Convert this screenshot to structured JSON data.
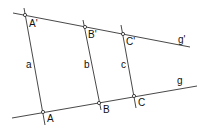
{
  "diagram": {
    "type": "parallel-lines-geometry",
    "colors": {
      "line": "#333333",
      "text": "#111111",
      "background": "#ffffff"
    },
    "lines": [
      {
        "id": "g_prime",
        "label": "g'",
        "x1": 13,
        "y1": 13,
        "x2": 190,
        "y2": 47
      },
      {
        "id": "g",
        "label": "g",
        "x1": 12,
        "y1": 118,
        "x2": 197,
        "y2": 86
      },
      {
        "id": "a",
        "label": "a",
        "x1": 24,
        "y1": 8,
        "x2": 45,
        "y2": 125
      },
      {
        "id": "b",
        "label": "b",
        "x1": 83,
        "y1": 20,
        "x2": 101,
        "y2": 110
      },
      {
        "id": "c",
        "label": "c",
        "x1": 121,
        "y1": 25,
        "x2": 136,
        "y2": 108
      }
    ],
    "points": [
      {
        "id": "A_prime",
        "label": "A'",
        "x": 25,
        "y": 15
      },
      {
        "id": "B_prime",
        "label": "B'",
        "x": 85,
        "y": 27
      },
      {
        "id": "C_prime",
        "label": "C'",
        "x": 123,
        "y": 34
      },
      {
        "id": "A",
        "label": "A",
        "x": 43,
        "y": 112
      },
      {
        "id": "B",
        "label": "B",
        "x": 99,
        "y": 103
      },
      {
        "id": "C",
        "label": "C",
        "x": 134,
        "y": 96
      }
    ],
    "labels": {
      "g_prime": "g'",
      "g": "g",
      "a": "a",
      "b": "b",
      "c": "c",
      "A_prime": "A'",
      "B_prime": "B'",
      "C_prime": "C'",
      "A": "A",
      "B": "B",
      "C": "C"
    }
  }
}
